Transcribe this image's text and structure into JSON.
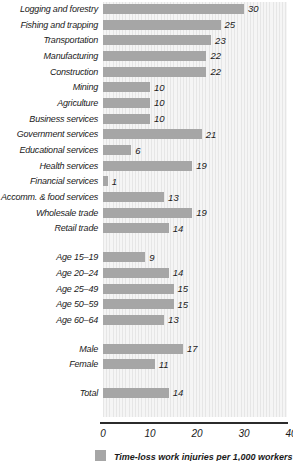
{
  "chart_data": {
    "type": "bar",
    "orientation": "horizontal",
    "title": "",
    "xlabel": "",
    "ylabel": "",
    "xlim": [
      0,
      40
    ],
    "x_ticks": [
      "0",
      "10",
      "20",
      "30",
      "40"
    ],
    "grid": false,
    "legend_position": "bottom",
    "legend": "Time-loss work injuries per 1,000 workers",
    "bar_color": "#a6a6a6",
    "groups": [
      {
        "name": "industry",
        "items": [
          {
            "label": "Logging and forestry",
            "value": 30
          },
          {
            "label": "Fishing and trapping",
            "value": 25
          },
          {
            "label": "Transportation",
            "value": 23
          },
          {
            "label": "Manufacturing",
            "value": 22
          },
          {
            "label": "Construction",
            "value": 22
          },
          {
            "label": "Mining",
            "value": 10
          },
          {
            "label": "Agriculture",
            "value": 10
          },
          {
            "label": "Business services",
            "value": 10
          },
          {
            "label": "Government services",
            "value": 21
          },
          {
            "label": "Educational services",
            "value": 6
          },
          {
            "label": "Health services",
            "value": 19
          },
          {
            "label": "Financial services",
            "value": 1
          },
          {
            "label": "Accomm. & food services",
            "value": 13
          },
          {
            "label": "Wholesale trade",
            "value": 19
          },
          {
            "label": "Retail trade",
            "value": 14
          }
        ]
      },
      {
        "name": "age",
        "items": [
          {
            "label": "Age 15–19",
            "value": 9
          },
          {
            "label": "Age 20–24",
            "value": 14
          },
          {
            "label": "Age 25–49",
            "value": 15
          },
          {
            "label": "Age 50–59",
            "value": 15
          },
          {
            "label": "Age 60–64",
            "value": 13
          }
        ]
      },
      {
        "name": "sex",
        "items": [
          {
            "label": "Male",
            "value": 17
          },
          {
            "label": "Female",
            "value": 11
          }
        ]
      },
      {
        "name": "total",
        "items": [
          {
            "label": "Total",
            "value": 14
          }
        ]
      }
    ]
  }
}
